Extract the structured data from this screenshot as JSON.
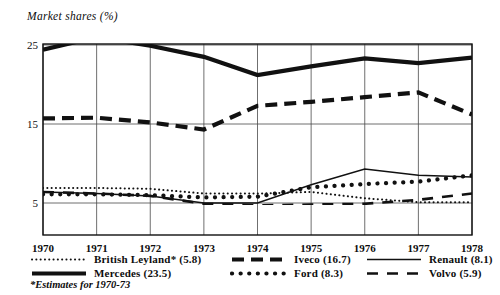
{
  "chart_data": {
    "type": "line",
    "title": "Market shares (%)",
    "xlabel": "",
    "ylabel": "Market shares (%)",
    "grid": true,
    "legend_position": "bottom",
    "footnote": "*Estimates for 1970-73",
    "categories": [
      "1970",
      "1971",
      "1972",
      "1973",
      "1974",
      "1975",
      "1976",
      "1977",
      "1978"
    ],
    "x": [
      1970,
      1971,
      1972,
      1973,
      1974,
      1975,
      1976,
      1977,
      1978
    ],
    "xlim": [
      1970,
      1978
    ],
    "ylim": [
      0,
      27.5
    ],
    "yticks": [
      5,
      15,
      25
    ],
    "ytick_labels": [
      "5",
      "15",
      "25"
    ],
    "series": [
      {
        "name": "Mercedes",
        "legend_label": "Mercedes  (23.5)",
        "average": 23.5,
        "style": "thick-solid",
        "values": [
          24.4,
          26.0,
          24.9,
          23.5,
          21.2,
          22.3,
          23.3,
          22.7,
          23.4
        ]
      },
      {
        "name": "Iveco",
        "legend_label": "Iveco (16.7)",
        "average": 16.7,
        "style": "thick-dashed",
        "values": [
          15.7,
          15.8,
          15.2,
          14.3,
          17.3,
          17.8,
          18.4,
          19.0,
          16.2
        ]
      },
      {
        "name": "Renault",
        "legend_label": "Renault  (8.1)",
        "average": 8.1,
        "style": "thin-solid",
        "values": [
          6.4,
          6.2,
          5.9,
          5.0,
          5.0,
          7.3,
          9.3,
          8.5,
          8.3
        ]
      },
      {
        "name": "Ford",
        "legend_label": "Ford (8.3)",
        "average": 8.3,
        "style": "thick-dotted",
        "values": [
          6.1,
          6.1,
          6.0,
          5.7,
          5.8,
          7.0,
          7.4,
          7.7,
          8.5
        ]
      },
      {
        "name": "British Leyland*",
        "legend_label": "British Leyland* (5.8)",
        "average": 5.8,
        "style": "fine-dotted",
        "values": [
          6.9,
          6.9,
          6.8,
          6.2,
          6.2,
          6.4,
          5.6,
          5.1,
          5.1
        ]
      },
      {
        "name": "Volvo",
        "legend_label": "Volvo  (5.9)",
        "average": 5.9,
        "style": "thick-long-dashed",
        "values": [
          6.4,
          6.2,
          5.9,
          4.9,
          4.7,
          4.8,
          4.9,
          5.4,
          6.2
        ]
      }
    ]
  },
  "axis": {
    "y_labels": [
      "25",
      "15",
      "5"
    ],
    "x_labels": [
      "1970",
      "1971",
      "1972",
      "1973",
      "1974",
      "1975",
      "1976",
      "1977",
      "1978"
    ]
  },
  "legend": {
    "rows": [
      [
        {
          "key": "british-leyland",
          "label": "British Leyland* (5.8)",
          "style": "fine-dotted"
        },
        {
          "key": "iveco",
          "label": "Iveco (16.7)",
          "style": "thick-dashed"
        },
        {
          "key": "renault",
          "label": "Renault  (8.1)",
          "style": "thin-solid"
        }
      ],
      [
        {
          "key": "mercedes",
          "label": "Mercedes  (23.5)",
          "style": "thick-solid"
        },
        {
          "key": "ford",
          "label": "Ford (8.3)",
          "style": "thick-dotted"
        },
        {
          "key": "volvo",
          "label": "Volvo  (5.9)",
          "style": "thick-long-dashed"
        }
      ]
    ]
  },
  "footnote": "*Estimates for 1970-73"
}
